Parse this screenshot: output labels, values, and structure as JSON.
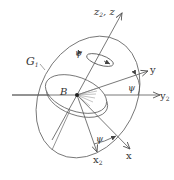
{
  "diagram": {
    "type": "gyroscope-coordinate-frames",
    "labels": {
      "z_axis": "z",
      "z_axis_sub": "2",
      "z_axis_alt": ", z",
      "y_axis": "y",
      "y2_axis": "y",
      "y2_sub": "2",
      "x_axis": "x",
      "x2_axis": "x",
      "x2_sub": "2",
      "gimbal": "G",
      "gimbal_sub": "1",
      "body": "B",
      "psi_top": "ψ",
      "psi_right": "ψ",
      "psi_bottom": "ψ"
    },
    "colors": {
      "line": "#555555",
      "text": "#333333",
      "background": "#ffffff"
    }
  }
}
